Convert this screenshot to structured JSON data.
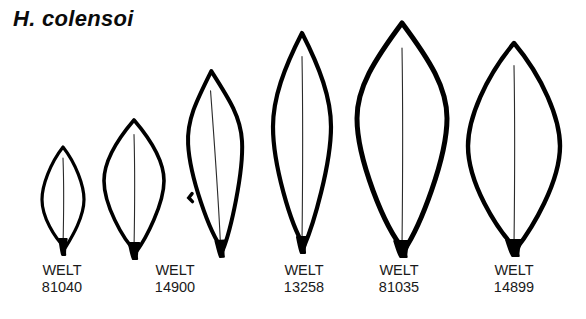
{
  "plate": {
    "taxon_name": "H. colensoi",
    "background_color": "#ffffff",
    "ink_color": "#000000",
    "figure_type": "botanical leaf silhouette plate",
    "specimen_count": 6,
    "labeled_specimen_count": 5
  },
  "specimens": [
    {
      "index": 1,
      "institution": "WELT",
      "accession": "81040",
      "label_center_x": 62,
      "label_top_y": 262,
      "leaf": {
        "axis_x": 63,
        "apex_y": 147,
        "base_y": 248,
        "half_width": 21,
        "widest_y_frac": 0.52,
        "shape": "narrow elliptic, acute apex",
        "outline_width": 3.2,
        "midrib": true,
        "petiole": true,
        "notch": null,
        "tilt": 0
      }
    },
    {
      "index": 2,
      "institution": "WELT",
      "accession": "14900",
      "label_center_x": 175,
      "label_top_y": 262,
      "leaf": {
        "axis_x": 134,
        "apex_y": 120,
        "base_y": 252,
        "half_width": 30,
        "widest_y_frac": 0.46,
        "shape": "ovate-elliptic, acute apex",
        "outline_width": 3.6,
        "midrib": true,
        "petiole": true,
        "notch": null,
        "tilt": 0
      }
    },
    {
      "index": 3,
      "institution": null,
      "accession": null,
      "label_center_x": null,
      "label_top_y": null,
      "leaf": {
        "axis_x": 216,
        "apex_y": 71,
        "base_y": 250,
        "half_width": 27,
        "widest_y_frac": 0.4,
        "shape": "narrow lanceolate, asymmetric, falcate",
        "outline_width": 4.0,
        "midrib": true,
        "petiole": true,
        "notch": "left margin",
        "tilt": -3
      }
    },
    {
      "index": 4,
      "institution": "WELT",
      "accession": "13258",
      "label_center_x": 304,
      "label_top_y": 262,
      "leaf": {
        "axis_x": 302,
        "apex_y": 33,
        "base_y": 246,
        "half_width": 29,
        "widest_y_frac": 0.44,
        "shape": "narrow elliptic-lanceolate",
        "outline_width": 4.2,
        "midrib": true,
        "petiole": true,
        "notch": null,
        "tilt": 0
      }
    },
    {
      "index": 5,
      "institution": "WELT",
      "accession": "81035",
      "label_center_x": 399,
      "label_top_y": 262,
      "leaf": {
        "axis_x": 402,
        "apex_y": 23,
        "base_y": 250,
        "half_width": 45,
        "widest_y_frac": 0.42,
        "shape": "broad ovate-elliptic, acute apex",
        "outline_width": 5.0,
        "midrib": true,
        "petiole": true,
        "notch": null,
        "tilt": 0
      }
    },
    {
      "index": 6,
      "institution": "WELT",
      "accession": "14899",
      "label_center_x": 514,
      "label_top_y": 262,
      "leaf": {
        "axis_x": 514,
        "apex_y": 43,
        "base_y": 249,
        "half_width": 46,
        "widest_y_frac": 0.5,
        "shape": "broad elliptic, acute apex and base",
        "outline_width": 4.4,
        "midrib": true,
        "petiole": true,
        "notch": null,
        "tilt": 0
      }
    }
  ]
}
